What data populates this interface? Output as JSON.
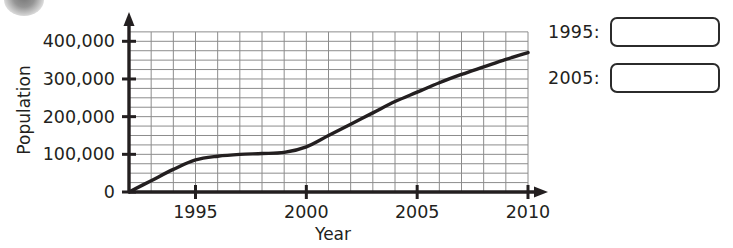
{
  "badge": {
    "icon": "circle-badge"
  },
  "chart_data": {
    "type": "line",
    "title": "",
    "xlabel": "Year",
    "ylabel": "Population",
    "xlim": [
      1992,
      2010
    ],
    "ylim": [
      0,
      430000
    ],
    "xticks": [
      1995,
      2000,
      2005,
      2010
    ],
    "xtick_labels": [
      "1995",
      "2000",
      "2005",
      "2010"
    ],
    "yticks": [
      0,
      100000,
      200000,
      300000,
      400000
    ],
    "ytick_labels": [
      "0",
      "100,000",
      "200,000",
      "300,000",
      "400,000"
    ],
    "grid": true,
    "grid_x_step": 1,
    "grid_y_step": 25000,
    "legend": "none",
    "series": [
      {
        "name": "Population",
        "x": [
          1992,
          1993,
          1994,
          1995,
          1996,
          1997,
          1998,
          1999,
          2000,
          2001,
          2002,
          2003,
          2004,
          2005,
          2006,
          2007,
          2008,
          2009,
          2010
        ],
        "values": [
          0,
          30000,
          60000,
          85000,
          95000,
          100000,
          102000,
          105000,
          120000,
          150000,
          180000,
          210000,
          240000,
          265000,
          290000,
          312000,
          332000,
          352000,
          370000
        ]
      }
    ]
  },
  "answers": {
    "rows": [
      {
        "label": "1995:",
        "value": ""
      },
      {
        "label": "2005:",
        "value": ""
      }
    ]
  }
}
